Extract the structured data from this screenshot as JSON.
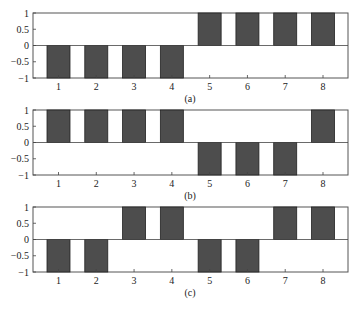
{
  "chart_data": [
    {
      "type": "bar",
      "title": "",
      "caption": "(a)",
      "xlabel": "",
      "ylabel": "",
      "categories": [
        "1",
        "2",
        "3",
        "4",
        "5",
        "6",
        "7",
        "8"
      ],
      "values": [
        -1,
        -1,
        -1,
        -1,
        1,
        1,
        1,
        1
      ],
      "ylim": [
        -1,
        1
      ],
      "yticks": [
        "1",
        "0.5",
        "0",
        "−0.5",
        "−1"
      ],
      "grid": false,
      "legend": null,
      "bar_color": "#4d4d4d"
    },
    {
      "type": "bar",
      "title": "",
      "caption": "(b)",
      "xlabel": "",
      "ylabel": "",
      "categories": [
        "1",
        "2",
        "3",
        "4",
        "5",
        "6",
        "7",
        "8"
      ],
      "values": [
        1,
        1,
        1,
        1,
        -1,
        -1,
        -1,
        1
      ],
      "ylim": [
        -1,
        1
      ],
      "yticks": [
        "1",
        "0.5",
        "0",
        "−0.5",
        "−1"
      ],
      "grid": false,
      "legend": null,
      "bar_color": "#4d4d4d"
    },
    {
      "type": "bar",
      "title": "",
      "caption": "(c)",
      "xlabel": "",
      "ylabel": "",
      "categories": [
        "1",
        "2",
        "3",
        "4",
        "5",
        "6",
        "7",
        "8"
      ],
      "values": [
        -1,
        -1,
        1,
        1,
        -1,
        -1,
        1,
        1
      ],
      "ylim": [
        -1,
        1
      ],
      "yticks": [
        "1",
        "0.5",
        "0",
        "−0.5",
        "−1"
      ],
      "grid": false,
      "legend": null,
      "bar_color": "#4d4d4d"
    }
  ]
}
